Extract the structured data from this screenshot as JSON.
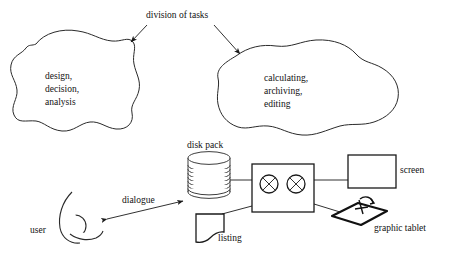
{
  "diagram": {
    "title_label": "division of tasks",
    "human_domain": {
      "name": "human-task-blob",
      "lines": [
        "design,",
        "decision,",
        "analysis"
      ]
    },
    "machine_domain": {
      "name": "machine-task-blob",
      "lines": [
        "calculating,",
        "archiving,",
        "editing"
      ]
    },
    "components": {
      "disk_pack_label": "disk pack",
      "screen_label": "screen",
      "listing_label": "listing",
      "graphic_tablet_label": "graphic tablet",
      "user_label": "user",
      "dialogue_label": "dialogue",
      "cpu_label": ""
    },
    "colors": {
      "background": "#ffffff",
      "ink": "#1a1a1a",
      "text": "#111111",
      "blob_stroke": "#2a2a2a"
    }
  }
}
